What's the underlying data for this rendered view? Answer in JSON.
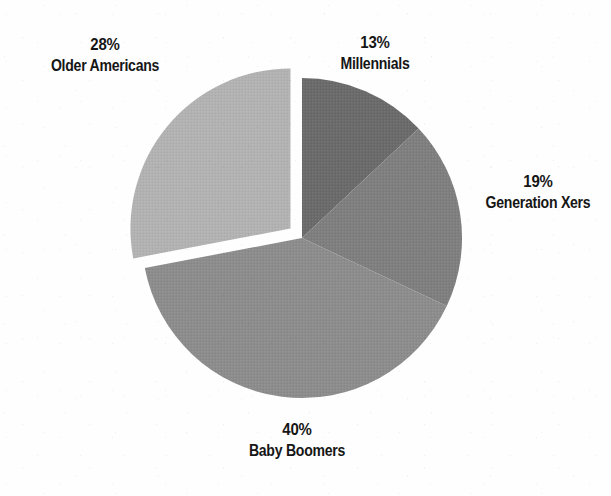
{
  "chart_data": {
    "type": "pie",
    "title": "",
    "subtitle": "",
    "legend_position": "labels-outside-slices",
    "grid": false,
    "units": "percent",
    "total": 100,
    "start_angle_deg": 0,
    "direction": "clockwise",
    "categories": [
      "Millennials",
      "Generation Xers",
      "Baby Boomers",
      "Older Americans"
    ],
    "values": [
      13,
      19,
      40,
      28
    ],
    "slices": [
      {
        "label": "Millennials",
        "value": 13,
        "value_text": "13%",
        "color": "#6a6a6a",
        "exploded": false,
        "start_angle_deg": 0,
        "end_angle_deg": 46.8,
        "label_position": "top-right"
      },
      {
        "label": "Generation Xers",
        "value": 19,
        "value_text": "19%",
        "color": "#7e7e7e",
        "exploded": false,
        "start_angle_deg": 46.8,
        "end_angle_deg": 115.2,
        "label_position": "right"
      },
      {
        "label": "Baby Boomers",
        "value": 40,
        "value_text": "40%",
        "color": "#8c8c8c",
        "exploded": false,
        "start_angle_deg": 115.2,
        "end_angle_deg": 259.2,
        "label_position": "bottom"
      },
      {
        "label": "Older Americans",
        "value": 28,
        "value_text": "28%",
        "color": "#b2b2b2",
        "exploded": true,
        "start_angle_deg": 259.2,
        "end_angle_deg": 360,
        "label_position": "top-left"
      }
    ]
  },
  "labels": {
    "millennials": {
      "pct": "13%",
      "name": "Millennials"
    },
    "generation_xers": {
      "pct": "19%",
      "name": "Generation Xers"
    },
    "baby_boomers": {
      "pct": "40%",
      "name": "Baby Boomers"
    },
    "older_americans": {
      "pct": "28%",
      "name": "Older Americans"
    }
  },
  "geometry": {
    "center_x": 302,
    "center_y": 238,
    "radius": 160,
    "explode_offset": 15
  },
  "colors": {
    "background": "#fefefe",
    "text": "#161616",
    "millennials": "#6a6a6a",
    "generation_xers": "#7e7e7e",
    "baby_boomers": "#8c8c8c",
    "older_americans": "#b2b2b2"
  }
}
